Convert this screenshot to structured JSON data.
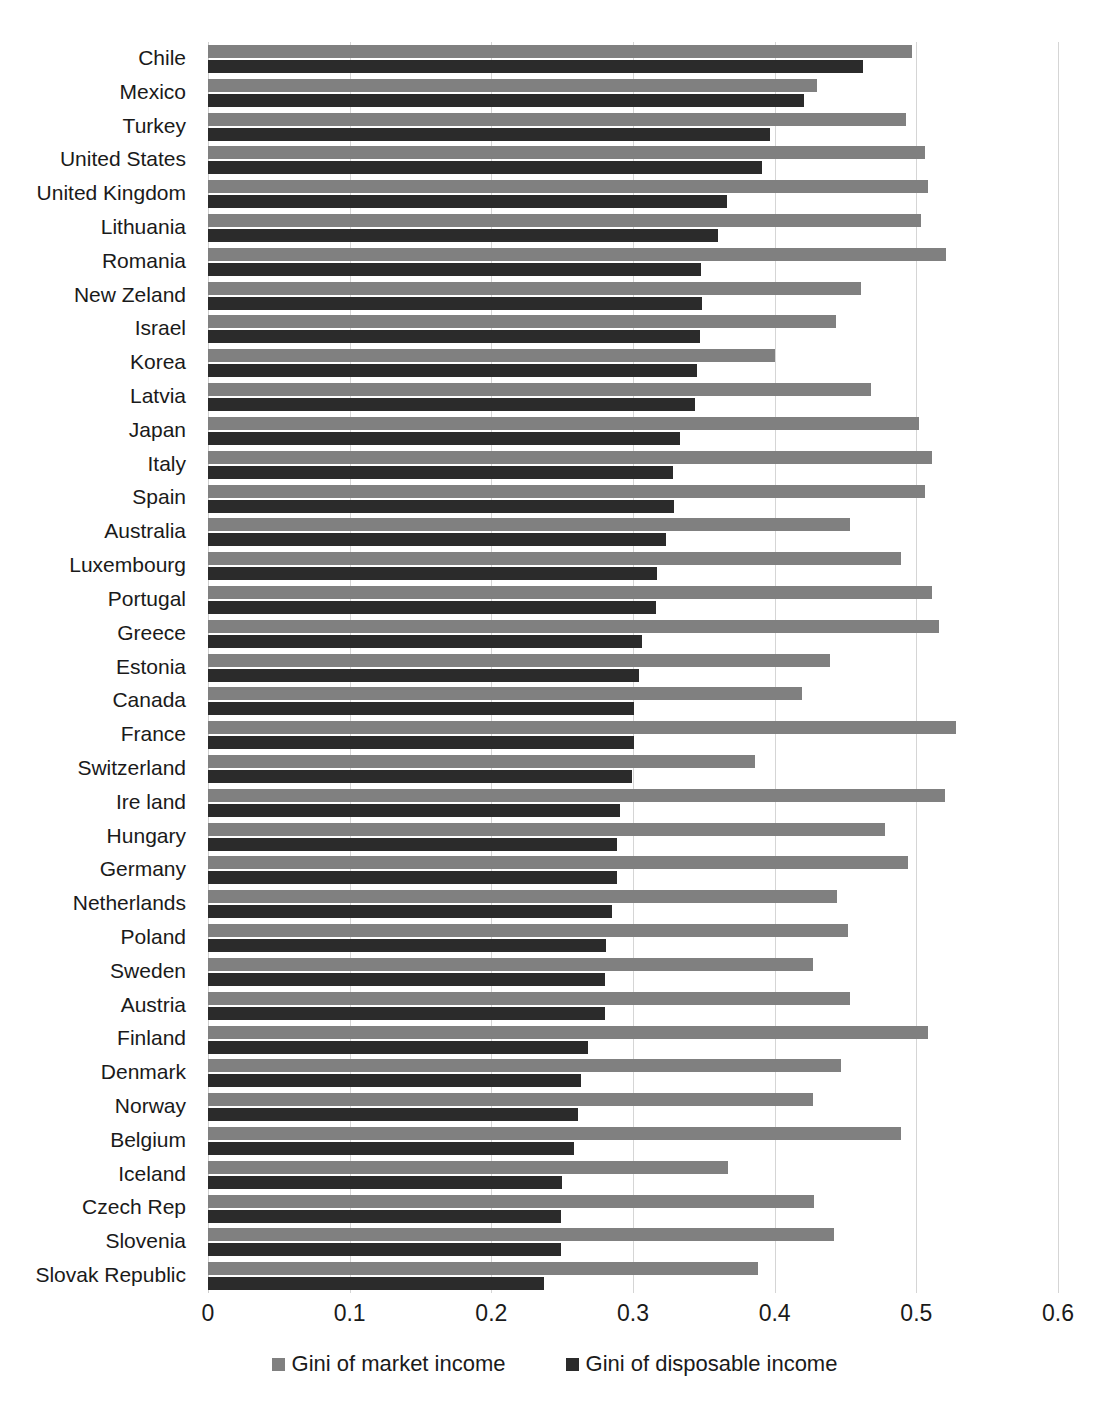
{
  "chart_data": {
    "type": "bar",
    "orientation": "horizontal",
    "title": "",
    "subtitle": "",
    "xlabel": "",
    "ylabel": "",
    "xlim": [
      0,
      0.6
    ],
    "xticks": [
      0,
      0.1,
      0.2,
      0.3,
      0.4,
      0.5,
      0.6
    ],
    "xtick_labels": [
      "0",
      "0.1",
      "0.2",
      "0.3",
      "0.4",
      "0.5",
      "0.6"
    ],
    "grid": true,
    "legend_position": "bottom",
    "colors": {
      "market": "#808080",
      "disposable": "#2b2b2b",
      "gridline": "#d5d5d5",
      "background": "#ffffff",
      "text": "#1a1a1a"
    },
    "categories": [
      "Chile",
      "Mexico",
      "Turkey",
      "United States",
      "United Kingdom",
      "Lithuania",
      "Romania",
      "New Zeland",
      "Israel",
      "Korea",
      "Latvia",
      "Japan",
      "Italy",
      "Spain",
      "Australia",
      "Luxembourg",
      "Portugal",
      "Greece",
      "Estonia",
      "Canada",
      "France",
      "Switzerland",
      "Ire land",
      "Hungary",
      "Germany",
      "Netherlands",
      "Poland",
      "Sweden",
      "Austria",
      "Finland",
      "Denmark",
      "Norway",
      "Belgium",
      "Iceland",
      "Czech Rep",
      "Slovenia",
      "Slovak Republic"
    ],
    "series": [
      {
        "name": "Gini of market income",
        "color": "#808080",
        "values": [
          0.497,
          0.43,
          0.493,
          0.506,
          0.508,
          0.503,
          0.521,
          0.461,
          0.443,
          0.4,
          0.468,
          0.502,
          0.511,
          0.506,
          0.453,
          0.489,
          0.511,
          0.516,
          0.439,
          0.419,
          0.528,
          0.386,
          0.52,
          0.478,
          0.494,
          0.444,
          0.452,
          0.427,
          0.453,
          0.508,
          0.447,
          0.427,
          0.489,
          0.367,
          0.428,
          0.442,
          0.388
        ]
      },
      {
        "name": "Gini of disposable income",
        "color": "#2b2b2b",
        "values": [
          0.462,
          0.421,
          0.397,
          0.391,
          0.366,
          0.36,
          0.348,
          0.349,
          0.347,
          0.345,
          0.344,
          0.333,
          0.328,
          0.329,
          0.323,
          0.317,
          0.316,
          0.306,
          0.304,
          0.301,
          0.301,
          0.299,
          0.291,
          0.289,
          0.289,
          0.285,
          0.281,
          0.28,
          0.28,
          0.268,
          0.263,
          0.261,
          0.258,
          0.25,
          0.249,
          0.249,
          0.237
        ]
      }
    ]
  },
  "legend": {
    "items": [
      {
        "label": "Gini of market income",
        "swatch": "market"
      },
      {
        "label": "Gini of disposable income",
        "swatch": "disposable"
      }
    ]
  }
}
